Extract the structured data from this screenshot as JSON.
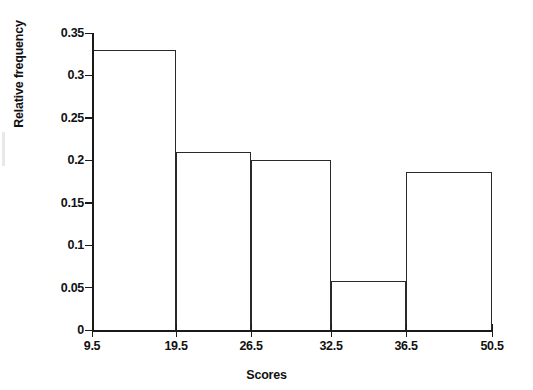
{
  "chart_data": {
    "type": "bar",
    "title": "",
    "subtitle": "",
    "xlabel": "Scores",
    "ylabel": "Relative frequency",
    "grid": false,
    "legend": null,
    "bin_edges": [
      9.5,
      19.5,
      26.5,
      32.5,
      36.5,
      50.5
    ],
    "categories": [
      "9.5-19.5",
      "19.5-26.5",
      "26.5-32.5",
      "32.5-36.5",
      "36.5-50.5"
    ],
    "values": [
      0.33,
      0.21,
      0.2,
      0.058,
      0.186
    ],
    "xtick_labels": [
      "9.5",
      "19.5",
      "26.5",
      "32.5",
      "36.5",
      "50.5"
    ],
    "ytick_labels": [
      "0",
      "0.05",
      "0.1",
      "0.15",
      "0.2",
      "0.25",
      "0.3",
      "0.35"
    ],
    "ytick_values": [
      0,
      0.05,
      0.1,
      0.15,
      0.2,
      0.25,
      0.3,
      0.35
    ],
    "ylim": [
      0,
      0.35
    ],
    "xlim": [
      9.5,
      50.5
    ],
    "bar_fill_color": "#ffffff",
    "bar_edge_color": "#2a2a2a",
    "axis_color": "#1a1a1a",
    "background_color": "#ffffff"
  }
}
